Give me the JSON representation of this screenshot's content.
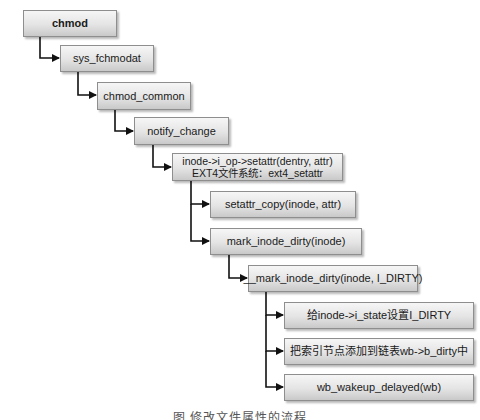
{
  "diagram": {
    "type": "call-tree",
    "nodes": [
      {
        "id": "chmod",
        "lines": [
          "chmod"
        ],
        "bold": true
      },
      {
        "id": "sys_fchmodat",
        "lines": [
          "sys_fchmodat"
        ]
      },
      {
        "id": "chmod_common",
        "lines": [
          "chmod_common"
        ]
      },
      {
        "id": "notify_change",
        "lines": [
          "notify_change"
        ]
      },
      {
        "id": "setattr",
        "lines": [
          "inode->i_op->setattr(dentry, attr)",
          "EXT4文件系统：ext4_setattr"
        ]
      },
      {
        "id": "setattr_copy",
        "lines": [
          "setattr_copy(inode, attr)"
        ]
      },
      {
        "id": "mark_inode_dirty",
        "lines": [
          "mark_inode_dirty(inode)"
        ]
      },
      {
        "id": "__mark_inode_dirty",
        "lines": [
          "__mark_inode_dirty(inode, I_DIRTY)"
        ]
      },
      {
        "id": "set_i_state",
        "lines": [
          "给inode->i_state设置I_DIRTY"
        ]
      },
      {
        "id": "add_to_b_dirty",
        "lines": [
          "把索引节点添加到链表wb->b_dirty中"
        ]
      },
      {
        "id": "wb_wakeup_delayed",
        "lines": [
          "wb_wakeup_delayed(wb)"
        ]
      }
    ],
    "edges": [
      [
        "chmod",
        "sys_fchmodat"
      ],
      [
        "sys_fchmodat",
        "chmod_common"
      ],
      [
        "chmod_common",
        "notify_change"
      ],
      [
        "notify_change",
        "setattr"
      ],
      [
        "setattr",
        "setattr_copy"
      ],
      [
        "setattr",
        "mark_inode_dirty"
      ],
      [
        "mark_inode_dirty",
        "__mark_inode_dirty"
      ],
      [
        "__mark_inode_dirty",
        "set_i_state"
      ],
      [
        "__mark_inode_dirty",
        "add_to_b_dirty"
      ],
      [
        "__mark_inode_dirty",
        "wb_wakeup_delayed"
      ]
    ],
    "caption": "图 修改文件属性的流程"
  }
}
